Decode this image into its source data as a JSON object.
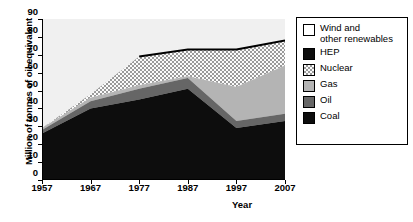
{
  "chart_data": {
    "type": "area",
    "title": "",
    "xlabel": "Year",
    "ylabel": "Million of tonnes of oil equivalent",
    "x": [
      1957,
      1967,
      1977,
      1987,
      1997,
      2007
    ],
    "categories": [
      "1957",
      "1967",
      "1977",
      "1987",
      "1997",
      "2007"
    ],
    "xlim": [
      1957,
      2007
    ],
    "ylim": [
      0,
      90
    ],
    "y_ticks": [
      0,
      10,
      20,
      30,
      40,
      50,
      60,
      70,
      80,
      90
    ],
    "x_ticks": [
      "1957",
      "1967",
      "1977",
      "1987",
      "1997",
      "2007"
    ],
    "grid": false,
    "stacked": true,
    "legend_position": "right",
    "series": [
      {
        "name": "Coal",
        "color": "#0d0d0d",
        "pattern": "solid",
        "values": [
          26,
          40,
          45,
          51,
          29,
          33
        ]
      },
      {
        "name": "Oil",
        "color": "#666666",
        "pattern": "solid",
        "values": [
          2,
          4,
          6,
          6,
          4,
          4
        ]
      },
      {
        "name": "Gas",
        "color": "#b4b4b4",
        "pattern": "solid",
        "values": [
          1,
          2,
          2,
          1,
          19,
          27
        ]
      },
      {
        "name": "Nuclear",
        "color": "#e8e8e8",
        "pattern": "checker",
        "values": [
          0,
          2,
          16,
          15,
          21,
          14
        ]
      },
      {
        "name": "Wind and\nother renewables",
        "color": "#ffffff",
        "pattern": "solid",
        "values": [
          61,
          42,
          21,
          17,
          17,
          12
        ]
      }
    ],
    "cumulative_tops": {
      "coal": [
        26,
        40,
        45,
        51,
        29,
        33
      ],
      "oil": [
        28,
        44,
        51,
        57,
        33,
        37
      ],
      "gas": [
        29,
        46,
        53,
        58,
        52,
        64
      ],
      "nuclear": [
        29,
        48,
        69,
        73,
        73,
        78
      ]
    },
    "hep_line": {
      "name": "HEP",
      "color": "#000000",
      "x": [
        1977,
        1987,
        1997,
        2007
      ],
      "values": [
        69,
        73,
        73,
        78
      ]
    },
    "plot_background": "#e8e8e8"
  },
  "legend": {
    "items": [
      {
        "label": "Wind and\nother renewables",
        "swatch": "wind-swatch"
      },
      {
        "label": "HEP",
        "swatch": "hep-swatch"
      },
      {
        "label": "Nuclear",
        "swatch": "nuclear-swatch"
      },
      {
        "label": "Gas",
        "swatch": "gas-swatch"
      },
      {
        "label": "Oil",
        "swatch": "oil-swatch"
      },
      {
        "label": "Coal",
        "swatch": "coal-swatch"
      }
    ]
  }
}
